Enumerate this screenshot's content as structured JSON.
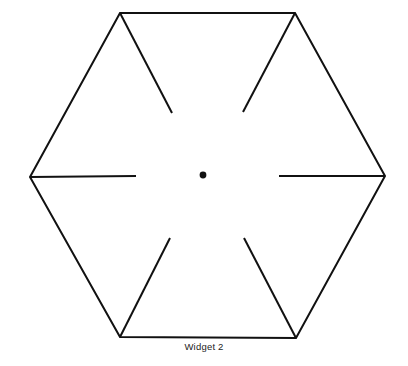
{
  "figure": {
    "caption": "Widget 2",
    "shape_name": "hexagon",
    "background_color": "#ffffff",
    "stroke_color": "#111111",
    "stroke_width": 2,
    "hub_dot": {
      "label": "center-hub-dot",
      "cx": 203,
      "cy": 175,
      "r": 3.4,
      "fill": "#111111"
    },
    "hexagon": {
      "label": "hexagon-outline",
      "center": [
        203,
        175
      ],
      "vertices": [
        {
          "name": "top-left",
          "x": 120,
          "y": 13
        },
        {
          "name": "top-right",
          "x": 295,
          "y": 13
        },
        {
          "name": "right",
          "x": 385,
          "y": 176
        },
        {
          "name": "bottom-right",
          "x": 296,
          "y": 338
        },
        {
          "name": "bottom-left",
          "x": 120,
          "y": 337
        },
        {
          "name": "left",
          "x": 30,
          "y": 177
        }
      ]
    },
    "spokes": [
      {
        "name": "spoke-top-left",
        "x1": 120,
        "y1": 13,
        "x2": 172,
        "y2": 113
      },
      {
        "name": "spoke-top-right",
        "x1": 295,
        "y1": 13,
        "x2": 243,
        "y2": 112
      },
      {
        "name": "spoke-right",
        "x1": 385,
        "y1": 176,
        "x2": 279,
        "y2": 176
      },
      {
        "name": "spoke-bottom-right",
        "x1": 296,
        "y1": 338,
        "x2": 244,
        "y2": 238
      },
      {
        "name": "spoke-bottom-left",
        "x1": 120,
        "y1": 337,
        "x2": 170,
        "y2": 238
      },
      {
        "name": "spoke-left",
        "x1": 30,
        "y1": 177,
        "x2": 136,
        "y2": 176
      }
    ]
  }
}
